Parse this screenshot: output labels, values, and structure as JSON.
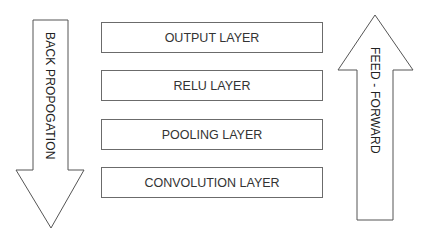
{
  "diagram": {
    "layers": [
      {
        "label": "OUTPUT LAYER"
      },
      {
        "label": "RELU LAYER"
      },
      {
        "label": "POOLING LAYER"
      },
      {
        "label": "CONVOLUTION LAYER"
      }
    ],
    "left_arrow": {
      "label": "BACK PROPOGATION",
      "direction": "down"
    },
    "right_arrow": {
      "label": "FEED - FORWARD",
      "direction": "up"
    }
  }
}
